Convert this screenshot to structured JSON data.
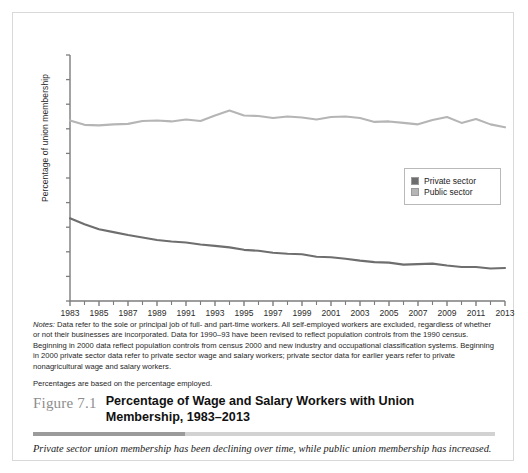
{
  "figure": {
    "number_label": "Figure 7.1",
    "title": "Percentage of Wage and Salary Workers with Union Membership, 1983–2013",
    "subcaption": "Private sector union membership has been declining over time, while public union membership has increased."
  },
  "notes": {
    "lead": "Notes:",
    "paragraph1": " Data refer to the sole or principal job of full- and part-time workers. All self-employed workers are excluded, regardless of whether or not their businesses are incorporated. Data for 1990–93 have been revised to reflect population controls from the 1990 census. Beginning in 2000 data reflect population controls from census 2000 and new industry and occupational classification systems. Beginning in 2000 private sector data refer to private sector wage and salary workers; private sector data for earlier years refer to private nonagricultural wage and salary workers.",
    "paragraph2": "Percentages are based on the percentage employed."
  },
  "legend": {
    "position": "inside-right",
    "items": [
      {
        "label": "Private sector",
        "color": "#6e6e6e"
      },
      {
        "label": "Public sector",
        "color": "#b5b5b5"
      }
    ]
  },
  "chart_data": {
    "type": "line",
    "title": "Percentage of Wage and Salary Workers with Union Membership, 1983–2013",
    "xlabel": "",
    "ylabel": "Percentage of union membership",
    "ylim": [
      0,
      50
    ],
    "xlim": [
      1983,
      2013
    ],
    "ytick_labels": [
      "0%",
      "5%",
      "10%",
      "15%",
      "20%",
      "25%",
      "30%",
      "35%",
      "40%",
      "45%",
      "50%"
    ],
    "ytick_values": [
      0,
      5,
      10,
      15,
      20,
      25,
      30,
      35,
      40,
      45,
      50
    ],
    "xtick_labels": [
      "1983",
      "1985",
      "1987",
      "1989",
      "1991",
      "1993",
      "1995",
      "1997",
      "1999",
      "2001",
      "2003",
      "2005",
      "2007",
      "2009",
      "2011",
      "2013"
    ],
    "xtick_values": [
      1983,
      1985,
      1987,
      1989,
      1991,
      1993,
      1995,
      1997,
      1999,
      2001,
      2003,
      2005,
      2007,
      2009,
      2011,
      2013
    ],
    "minor_xticks_every": 1,
    "grid": false,
    "x": [
      1983,
      1984,
      1985,
      1986,
      1987,
      1988,
      1989,
      1990,
      1991,
      1992,
      1993,
      1994,
      1995,
      1996,
      1997,
      1998,
      1999,
      2000,
      2001,
      2002,
      2003,
      2004,
      2005,
      2006,
      2007,
      2008,
      2009,
      2010,
      2011,
      2012,
      2013
    ],
    "series": [
      {
        "name": "Private sector",
        "color": "#6e6e6e",
        "values": [
          16.8,
          15.6,
          14.6,
          14.0,
          13.4,
          12.9,
          12.4,
          12.1,
          11.9,
          11.5,
          11.2,
          10.9,
          10.4,
          10.2,
          9.8,
          9.6,
          9.5,
          9.0,
          8.9,
          8.6,
          8.2,
          7.9,
          7.8,
          7.4,
          7.5,
          7.6,
          7.2,
          6.9,
          6.9,
          6.6,
          6.7
        ]
      },
      {
        "name": "Public sector",
        "color": "#b5b5b5",
        "values": [
          36.7,
          35.8,
          35.7,
          35.9,
          36.0,
          36.6,
          36.7,
          36.5,
          36.9,
          36.6,
          37.7,
          38.7,
          37.7,
          37.6,
          37.2,
          37.5,
          37.3,
          36.9,
          37.4,
          37.5,
          37.2,
          36.4,
          36.5,
          36.2,
          35.9,
          36.8,
          37.4,
          36.2,
          37.0,
          35.9,
          35.3
        ]
      }
    ]
  }
}
